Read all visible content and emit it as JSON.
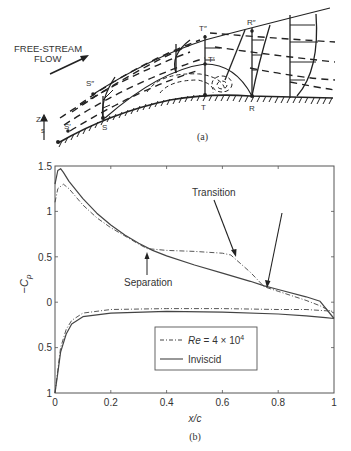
{
  "figure_a": {
    "caption": "(a)",
    "freestream_label_line1": "FREE-STREAM",
    "freestream_label_line2": "FLOW",
    "points": {
      "S_prime": "S′",
      "S": "S",
      "S_double": "S″",
      "T": "T",
      "T_prime": "T′",
      "T_double": "T″",
      "R": "R",
      "R_double": "R″"
    },
    "axis_z": "Z",
    "axis_s": "s"
  },
  "figure_b": {
    "caption": "(b)",
    "annotations": {
      "separation": "Separation",
      "transition": "Transition"
    },
    "legend": {
      "series_0": "Re = 4 × 10⁴",
      "series_0_re": "Re",
      "series_0_rest": " = 4 × 10",
      "series_0_exp": "4",
      "series_1": "Inviscid"
    }
  },
  "chart_data": {
    "type": "line",
    "title": "",
    "xlabel": "x/c",
    "ylabel": "-C_p",
    "xlim": [
      0,
      1
    ],
    "ylim": [
      -1,
      1.5
    ],
    "x_ticks": [
      "0",
      "0.2",
      "0.4",
      "0.6",
      "0.8",
      "1"
    ],
    "y_ticks": [
      "1.5",
      "1",
      "0.5",
      "0",
      "0.5",
      "1"
    ],
    "grid": false,
    "legend_position": "lower center-right",
    "annotations": [
      {
        "text": "Separation",
        "x": 0.33,
        "y": 0.58
      },
      {
        "text": "Transition",
        "x": 0.63,
        "y": 0.52
      },
      {
        "text": "Reattachment arrow",
        "x": 0.75,
        "y": 0.17
      }
    ],
    "series": [
      {
        "name": "Re = 4 × 10⁴ (upper)",
        "style": "dash-dot",
        "x": [
          0.0,
          0.01,
          0.03,
          0.05,
          0.1,
          0.15,
          0.2,
          0.25,
          0.3,
          0.33,
          0.4,
          0.5,
          0.6,
          0.63,
          0.7,
          0.75,
          0.8,
          0.9,
          0.95,
          1.0
        ],
        "y": [
          1.1,
          1.25,
          1.3,
          1.25,
          1.07,
          0.93,
          0.82,
          0.73,
          0.64,
          0.59,
          0.57,
          0.56,
          0.54,
          0.52,
          0.33,
          0.17,
          0.12,
          0.02,
          -0.04,
          -0.12
        ]
      },
      {
        "name": "Re = 4 × 10⁴ (lower)",
        "style": "dash-dot",
        "x": [
          0.0,
          0.01,
          0.02,
          0.04,
          0.06,
          0.1,
          0.2,
          0.4,
          0.6,
          0.8,
          0.9,
          1.0
        ],
        "y": [
          -1.0,
          -0.75,
          -0.5,
          -0.3,
          -0.2,
          -0.12,
          -0.08,
          -0.07,
          -0.07,
          -0.08,
          -0.08,
          -0.1
        ]
      },
      {
        "name": "Inviscid (upper)",
        "style": "solid",
        "x": [
          0.0,
          0.01,
          0.02,
          0.03,
          0.05,
          0.1,
          0.15,
          0.2,
          0.25,
          0.3,
          0.35,
          0.4,
          0.5,
          0.6,
          0.7,
          0.75,
          0.8,
          0.9,
          0.95,
          1.0
        ],
        "y": [
          1.3,
          1.45,
          1.47,
          1.43,
          1.33,
          1.14,
          0.98,
          0.85,
          0.74,
          0.65,
          0.57,
          0.51,
          0.41,
          0.32,
          0.23,
          0.18,
          0.14,
          0.06,
          0.01,
          -0.18
        ]
      },
      {
        "name": "Inviscid (lower)",
        "style": "solid",
        "x": [
          0.0,
          0.01,
          0.02,
          0.04,
          0.06,
          0.1,
          0.2,
          0.4,
          0.6,
          0.8,
          0.9,
          0.97,
          1.0
        ],
        "y": [
          -1.0,
          -0.78,
          -0.55,
          -0.35,
          -0.24,
          -0.16,
          -0.12,
          -0.1,
          -0.11,
          -0.13,
          -0.15,
          -0.17,
          -0.18
        ]
      }
    ]
  }
}
